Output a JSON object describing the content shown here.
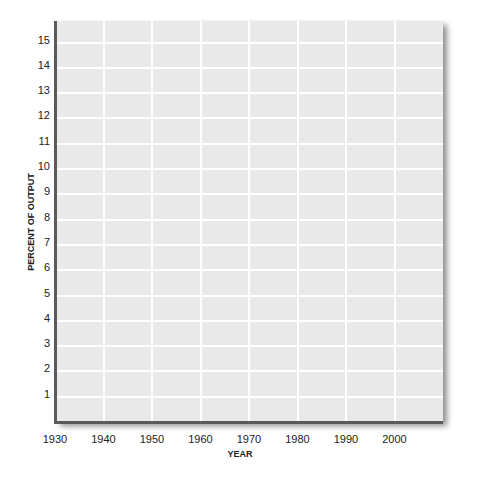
{
  "chart_data": {
    "type": "line",
    "title": "",
    "xlabel": "YEAR",
    "ylabel": "PERCENT OF OUTPUT",
    "x_ticks": [
      1930,
      1940,
      1950,
      1960,
      1970,
      1980,
      1990,
      2000
    ],
    "y_ticks": [
      1,
      2,
      3,
      4,
      5,
      6,
      7,
      8,
      9,
      10,
      11,
      12,
      13,
      14,
      15
    ],
    "xlim": [
      1930,
      2010
    ],
    "ylim": [
      0,
      15.9
    ],
    "grid": true,
    "legend": null,
    "series": []
  },
  "colors": {
    "plot_background": "#e9e9e9",
    "gridline": "#ffffff",
    "axis": "#5a5a5a"
  }
}
